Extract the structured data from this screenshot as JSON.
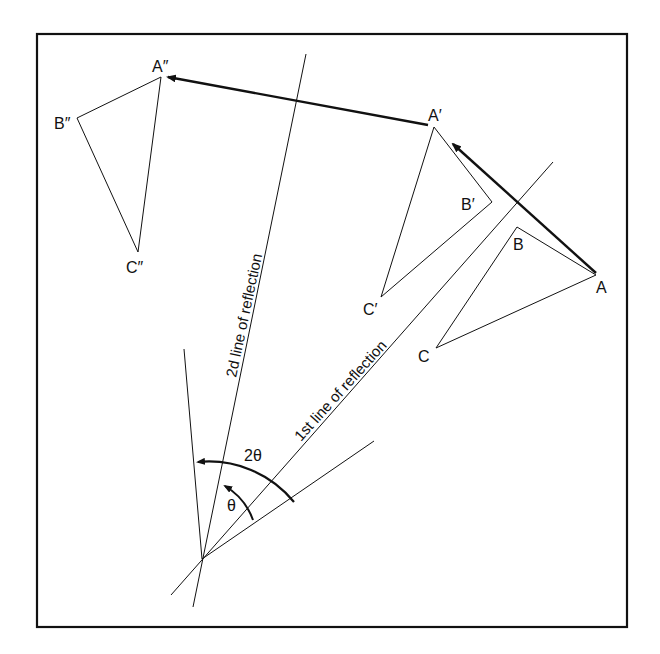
{
  "diagram": {
    "labels": {
      "original": {
        "A": "A",
        "B": "B",
        "C": "C"
      },
      "first_image": {
        "A": "A′",
        "B": "B′",
        "C": "C′"
      },
      "second_image": {
        "A": "A″",
        "B": "B″",
        "C": "C″"
      },
      "line1": "1st line of reflection",
      "line2": "2d line of reflection",
      "angle_theta": "θ",
      "angle_2theta": "2θ"
    },
    "colors": {
      "ink": "#111111",
      "background": "#ffffff"
    }
  }
}
